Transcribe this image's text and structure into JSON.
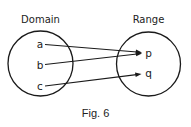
{
  "diagram": {
    "type": "function-mapping",
    "domain": {
      "title": "Domain",
      "elements": [
        "a",
        "b",
        "c"
      ]
    },
    "range": {
      "title": "Range",
      "elements": [
        "p",
        "q"
      ]
    },
    "mappings": [
      {
        "from": "a",
        "to": "p"
      },
      {
        "from": "b",
        "to": "p"
      },
      {
        "from": "c",
        "to": "q"
      }
    ],
    "caption": "Fig. 6"
  }
}
